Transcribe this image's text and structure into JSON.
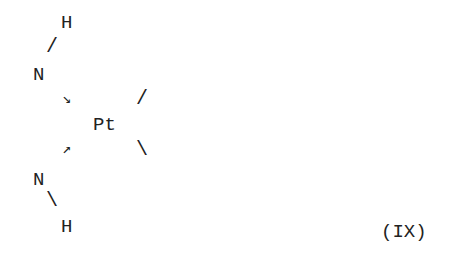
{
  "diagram": {
    "type": "chemical-structure",
    "label": "(IX)",
    "center_atom": "Pt",
    "atoms": {
      "h_top": "H",
      "n_top": "N",
      "pt": "Pt",
      "n_bottom": "N",
      "h_bottom": "H"
    },
    "bonds": {
      "h_n_top": "/",
      "pt_upper_right": "/",
      "pt_lower_right": "\\",
      "n_h_bottom": "\\"
    },
    "dative_arrows": {
      "n_top_to_pt": "↘",
      "n_bottom_to_pt": "↗"
    }
  }
}
